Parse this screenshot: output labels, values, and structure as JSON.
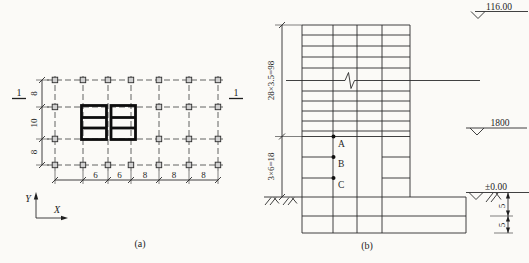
{
  "plan": {
    "section_marks": {
      "left": "1",
      "right": "1"
    },
    "dims_vertical": [
      "8",
      "10",
      "8"
    ],
    "dims_horizontal": [
      "6",
      "6",
      "8",
      "8",
      "8"
    ],
    "axes": {
      "y": "Y",
      "x": "X"
    },
    "caption": "(a)"
  },
  "elevation": {
    "dim_tower": "28×3.5=98",
    "dim_podium": "3×6=18",
    "levels": {
      "roof": "116.00",
      "mid": "1800",
      "ground": "±0.00"
    },
    "points": [
      "A",
      "B",
      "C"
    ],
    "dims_basement": [
      "5",
      "5"
    ],
    "caption": "(b)"
  },
  "colors": {
    "line": "#2b2b2b",
    "wall": "#0d0d0d",
    "paper": "#fbfaf7"
  }
}
